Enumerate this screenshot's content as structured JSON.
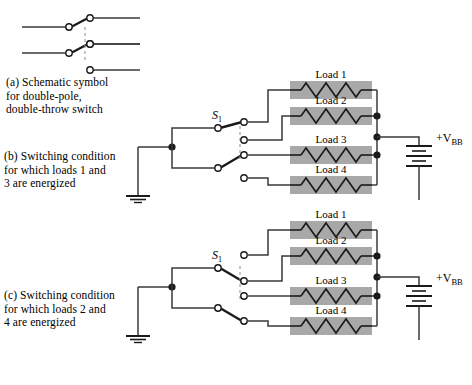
{
  "figure": {
    "background": "#ffffff",
    "wire_color": "#3a3a3a",
    "load_fill": "#a8a8a8",
    "node_color": "#1a1a1a"
  },
  "parts": {
    "a": {
      "caption": "(a) Schematic symbol\n     for double-pole,\n     double-throw switch"
    },
    "b": {
      "caption": "(b) Switching condition\n     for which loads 1 and\n     3 are energized",
      "switch_label": "S",
      "switch_sub": "1",
      "supply_label": "+V",
      "supply_sub": "BB",
      "energized": "1 and 3",
      "loads": [
        "Load 1",
        "Load 2",
        "Load 3",
        "Load 4"
      ]
    },
    "c": {
      "caption": "(c) Switching condition\n     for which loads 2 and\n     4 are energized",
      "switch_label": "S",
      "switch_sub": "1",
      "supply_label": "+V",
      "supply_sub": "BB",
      "energized": "2 and 4",
      "loads": [
        "Load 1",
        "Load 2",
        "Load 3",
        "Load 4"
      ]
    }
  }
}
